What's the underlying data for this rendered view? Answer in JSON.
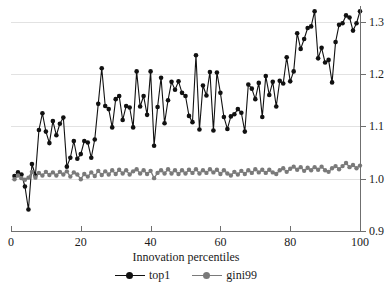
{
  "chart_data": {
    "type": "line",
    "title": "",
    "xlabel": "Innovation percentiles",
    "ylabel": "",
    "xlim": [
      0,
      100
    ],
    "ylim": [
      0.9,
      1.33
    ],
    "grid": true,
    "legend_position": "bottom",
    "x_ticks": [
      0,
      20,
      40,
      60,
      80,
      100
    ],
    "x_tick_labels": [
      "0",
      "20",
      "40",
      "60",
      "80",
      "100"
    ],
    "y_ticks": [
      0.9,
      1.0,
      1.1,
      1.2,
      1.3
    ],
    "y_tick_labels": [
      "0.9",
      "1.0",
      "1.1",
      "1.2",
      "1.3"
    ],
    "gridlines_y": [
      1.0,
      1.1,
      1.2,
      1.3
    ],
    "x": [
      1,
      2,
      3,
      4,
      5,
      6,
      7,
      8,
      9,
      10,
      11,
      12,
      13,
      14,
      15,
      16,
      17,
      18,
      19,
      20,
      21,
      22,
      23,
      24,
      25,
      26,
      27,
      28,
      29,
      30,
      31,
      32,
      33,
      34,
      35,
      36,
      37,
      38,
      39,
      40,
      41,
      42,
      43,
      44,
      45,
      46,
      47,
      48,
      49,
      50,
      51,
      52,
      53,
      54,
      55,
      56,
      57,
      58,
      59,
      60,
      61,
      62,
      63,
      64,
      65,
      66,
      67,
      68,
      69,
      70,
      71,
      72,
      73,
      74,
      75,
      76,
      77,
      78,
      79,
      80,
      81,
      82,
      83,
      84,
      85,
      86,
      87,
      88,
      89,
      90,
      91,
      92,
      93,
      94,
      95,
      96,
      97,
      98,
      99,
      100
    ],
    "series": [
      {
        "name": "top1",
        "color": "#111111",
        "marker": "filled-circle",
        "values": [
          1.005,
          1.012,
          1.008,
          0.985,
          0.941,
          1.028,
          1.006,
          1.093,
          1.125,
          1.09,
          1.068,
          1.11,
          1.083,
          1.105,
          1.117,
          1.023,
          1.04,
          1.072,
          1.038,
          1.047,
          1.072,
          1.069,
          1.04,
          1.075,
          1.143,
          1.211,
          1.139,
          1.133,
          1.098,
          1.152,
          1.158,
          1.112,
          1.139,
          1.136,
          1.098,
          1.205,
          1.138,
          1.158,
          1.122,
          1.205,
          1.063,
          1.137,
          1.193,
          1.106,
          1.15,
          1.185,
          1.17,
          1.186,
          1.164,
          1.158,
          1.12,
          1.108,
          1.236,
          1.094,
          1.178,
          1.159,
          1.204,
          1.092,
          1.203,
          1.164,
          1.118,
          1.095,
          1.119,
          1.123,
          1.133,
          1.126,
          1.09,
          1.18,
          1.172,
          1.152,
          1.183,
          1.118,
          1.196,
          1.16,
          1.185,
          1.138,
          1.187,
          1.182,
          1.232,
          1.186,
          1.205,
          1.278,
          1.248,
          1.267,
          1.288,
          1.291,
          1.32,
          1.23,
          1.25,
          1.222,
          1.227,
          1.184,
          1.261,
          1.294,
          1.297,
          1.312,
          1.308,
          1.283,
          1.297,
          1.32
        ]
      },
      {
        "name": "gini99",
        "color": "#7a7a7a",
        "marker": "filled-circle",
        "values": [
          0.999,
          1.006,
          1.001,
          0.998,
          1.002,
          1.013,
          1.002,
          1.011,
          1.006,
          1.013,
          1.007,
          1.012,
          1.006,
          1.013,
          1.008,
          1.014,
          1.004,
          1.012,
          1.008,
          0.999,
          1.009,
          1.004,
          1.012,
          1.005,
          1.015,
          1.007,
          1.014,
          1.008,
          1.016,
          1.009,
          1.017,
          1.01,
          1.016,
          1.008,
          1.014,
          1.018,
          1.01,
          1.016,
          1.009,
          1.015,
          1.001,
          1.011,
          1.016,
          1.01,
          1.018,
          1.01,
          1.016,
          1.009,
          1.016,
          1.01,
          1.017,
          1.011,
          1.018,
          1.01,
          1.016,
          1.011,
          1.018,
          1.012,
          1.017,
          1.009,
          1.016,
          1.01,
          1.006,
          1.013,
          1.008,
          1.015,
          1.009,
          1.016,
          1.011,
          1.018,
          1.012,
          1.017,
          1.011,
          1.017,
          1.012,
          1.009,
          1.016,
          1.02,
          1.013,
          1.019,
          1.023,
          1.017,
          1.022,
          1.015,
          1.021,
          1.016,
          1.022,
          1.017,
          1.023,
          1.016,
          1.013,
          1.02,
          1.024,
          1.018,
          1.024,
          1.03,
          1.022,
          1.026,
          1.02,
          1.025
        ]
      }
    ]
  },
  "legend": {
    "entries": [
      {
        "label": "top1"
      },
      {
        "label": "gini99"
      }
    ]
  }
}
